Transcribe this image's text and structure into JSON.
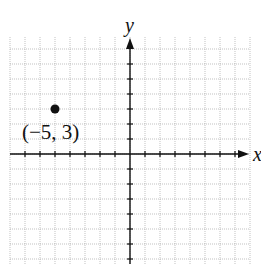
{
  "chart_data": {
    "type": "scatter",
    "title": "",
    "xlabel": "x",
    "ylabel": "y",
    "grid": true,
    "xlim": [
      -8,
      8
    ],
    "ylim": [
      -7,
      8
    ],
    "points": [
      {
        "x": -5,
        "y": 3,
        "label": "(−5, 3)"
      }
    ]
  },
  "labels": {
    "y_axis": "y",
    "x_axis": "x",
    "point": "(−5, 3)"
  }
}
